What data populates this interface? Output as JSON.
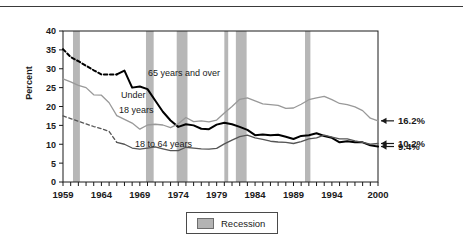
{
  "chart_data": {
    "type": "line",
    "title": "",
    "xlabel": "",
    "ylabel": "Percent",
    "xlim": [
      1959,
      2000
    ],
    "ylim": [
      0,
      40
    ],
    "ytick_labels": [
      "0",
      "5",
      "10",
      "15",
      "20",
      "25",
      "30",
      "35",
      "40"
    ],
    "ytick_values": [
      0,
      5,
      10,
      15,
      20,
      25,
      30,
      35,
      40
    ],
    "xtick_labels": [
      "1959",
      "1964",
      "1969",
      "1974",
      "1979",
      "1984",
      "1989",
      "1994",
      "2000"
    ],
    "xtick_values": [
      1959,
      1964,
      1969,
      1974,
      1979,
      1984,
      1989,
      1994,
      2000
    ],
    "grid": false,
    "legend_position": "bottom-center",
    "legend_entries": [
      "Recession"
    ],
    "x": [
      1959,
      1960,
      1961,
      1962,
      1963,
      1964,
      1965,
      1966,
      1967,
      1968,
      1969,
      1970,
      1971,
      1972,
      1973,
      1974,
      1975,
      1976,
      1977,
      1978,
      1979,
      1980,
      1981,
      1982,
      1983,
      1984,
      1985,
      1986,
      1987,
      1988,
      1989,
      1990,
      1991,
      1992,
      1993,
      1994,
      1995,
      1996,
      1997,
      1998,
      1999,
      2000
    ],
    "series": [
      {
        "name": "65 years and over",
        "color": "#000000",
        "style": "solid-thick",
        "dashed_until": 1966,
        "annotation": "65 years and over",
        "end_label": "9.4%",
        "values": [
          35.2,
          33.1,
          32.0,
          30.8,
          29.6,
          28.5,
          28.5,
          28.5,
          29.5,
          25.0,
          25.3,
          24.6,
          21.6,
          18.6,
          16.3,
          14.6,
          15.3,
          15.0,
          14.1,
          14.0,
          15.2,
          15.7,
          15.3,
          14.6,
          13.8,
          12.4,
          12.6,
          12.4,
          12.5,
          12.0,
          11.4,
          12.2,
          12.4,
          12.9,
          12.2,
          11.7,
          10.5,
          10.8,
          10.5,
          10.5,
          9.7,
          9.4
        ]
      },
      {
        "name": "Under 18 years",
        "color": "#999999",
        "style": "solid-light",
        "dashed_until": null,
        "annotation": "Under 18 years",
        "end_label": "16.2%",
        "values": [
          27.3,
          26.5,
          25.6,
          25.0,
          23.1,
          23.0,
          21.0,
          17.6,
          16.6,
          15.6,
          14.0,
          15.1,
          15.3,
          15.1,
          14.4,
          15.4,
          17.1,
          16.0,
          16.2,
          15.9,
          16.4,
          18.3,
          20.0,
          21.9,
          22.3,
          21.5,
          20.7,
          20.5,
          20.3,
          19.5,
          19.6,
          20.6,
          21.8,
          22.3,
          22.7,
          21.8,
          20.8,
          20.5,
          19.9,
          18.9,
          16.9,
          16.2
        ]
      },
      {
        "name": "18 to 64 years",
        "color": "#555555",
        "style": "solid-mid",
        "dashed_until": 1966,
        "annotation": "18 to 64 years",
        "end_label": "10.2%",
        "values": [
          17.5,
          16.8,
          16.1,
          15.4,
          14.7,
          14.1,
          13.4,
          10.5,
          10.0,
          9.0,
          8.7,
          9.0,
          9.3,
          8.8,
          8.3,
          8.3,
          9.2,
          9.0,
          8.8,
          8.7,
          8.9,
          10.1,
          11.1,
          12.0,
          12.4,
          11.7,
          11.3,
          10.8,
          10.6,
          10.5,
          10.2,
          10.7,
          11.4,
          11.7,
          12.4,
          11.9,
          11.4,
          11.4,
          10.9,
          10.5,
          10.0,
          10.2
        ]
      }
    ],
    "recession_bands": [
      {
        "start": 1960.3,
        "end": 1961.2
      },
      {
        "start": 1969.8,
        "end": 1970.8
      },
      {
        "start": 1973.8,
        "end": 1975.2
      },
      {
        "start": 1980.0,
        "end": 1980.5
      },
      {
        "start": 1981.5,
        "end": 1982.9
      },
      {
        "start": 1990.5,
        "end": 1991.2
      }
    ],
    "recession_color": "#b3b3b3",
    "end_labels": [
      {
        "text": "16.2%",
        "series": "Under 18 years",
        "value": 16.2
      },
      {
        "text": "10.2%",
        "series": "18 to 64 years",
        "value": 10.2
      },
      {
        "text": "9.4%",
        "series": "65 years and over",
        "value": 9.4
      }
    ]
  },
  "legend": {
    "swatch_name": "recession-swatch",
    "label": "Recession"
  },
  "axis": {
    "y_title": "Percent"
  }
}
